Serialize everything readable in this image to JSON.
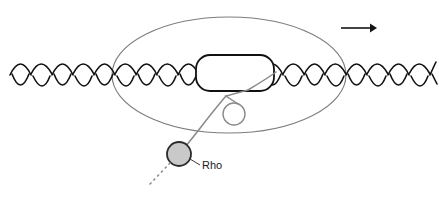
{
  "figure": {
    "background_color": "#ffffff"
  },
  "labels": {
    "rho": "Rho"
  },
  "colors": {
    "dna_strand": "#111111",
    "bubble_outline": "#111111",
    "polymerase_ellipse": "#7d7d7d",
    "rna_strand": "#8a8a8a",
    "rho_fill": "#c9c9c9",
    "rho_stroke": "#2b2b2b",
    "arrow": "#141414",
    "leader_line": "#3a3a3a",
    "text": "#1a1a1a"
  },
  "elements": {
    "dna": {
      "name": "dna-double-helix",
      "axis_y": 75,
      "x_start": 10,
      "x_end": 432,
      "amplitude": 13,
      "period": 42,
      "stroke_width": 1.6
    },
    "polymerase": {
      "name": "rna-polymerase-ellipse",
      "center_x": 229,
      "center_y": 75,
      "radius_x": 117,
      "radius_y": 58,
      "stroke_width": 1.1
    },
    "transcription_bubble": {
      "name": "transcription-bubble",
      "x": 196,
      "y": 55,
      "width": 78,
      "height": 36,
      "corner_radius": 14,
      "stroke_width": 1.8
    },
    "rna_hairpin_loop": {
      "name": "rna-hairpin-loop",
      "center_x": 234,
      "center_y": 114,
      "radius": 11,
      "stroke_width": 1.4
    },
    "rho_protein": {
      "name": "rho-protein-circle",
      "center_x": 179,
      "center_y": 154,
      "radius": 12,
      "stroke_width": 1.8
    },
    "direction_arrow": {
      "name": "transcription-direction-arrow",
      "x_start": 341,
      "x_end": 376,
      "y": 28,
      "stroke_width": 1.6
    },
    "rna_tail": {
      "name": "rna-nascent-transcript-tail",
      "dash_pattern": "1.5 4"
    },
    "rho_leader": {
      "name": "rho-leader-line",
      "from_x": 189,
      "from_y": 160,
      "to_x": 200,
      "to_y": 165
    }
  }
}
